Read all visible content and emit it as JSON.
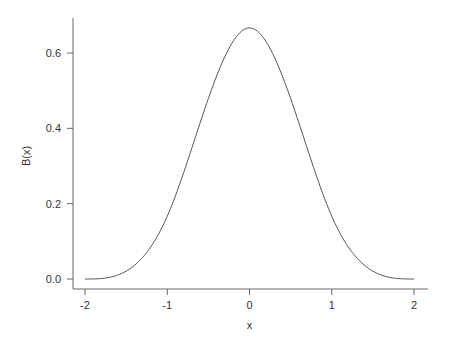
{
  "chart_data": {
    "type": "line",
    "title": "",
    "xlabel": "x",
    "ylabel": "B(x)",
    "xlim": [
      -2,
      2
    ],
    "ylim": [
      0,
      0.6667
    ],
    "x_ticks": [
      "-2",
      "-1",
      "0",
      "1",
      "2"
    ],
    "y_ticks": [
      "0.0",
      "0.2",
      "0.4",
      "0.6"
    ],
    "grid": false,
    "legend": null,
    "series": [
      {
        "name": "B(x)",
        "description": "cubic B-spline basis function",
        "x": [
          -2.0,
          -1.75,
          -1.5,
          -1.25,
          -1.0,
          -0.75,
          -0.5,
          -0.25,
          0.0,
          0.25,
          0.5,
          0.75,
          1.0,
          1.25,
          1.5,
          1.75,
          2.0
        ],
        "values": [
          0.0,
          0.0026,
          0.0208,
          0.0703,
          0.1667,
          0.3151,
          0.4792,
          0.6068,
          0.6667,
          0.6068,
          0.4792,
          0.3151,
          0.1667,
          0.0703,
          0.0208,
          0.0026,
          0.0
        ],
        "color": "#555555"
      }
    ]
  }
}
